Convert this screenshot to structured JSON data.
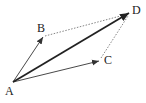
{
  "diagram": {
    "points": {
      "A": {
        "label": "A",
        "x": 13,
        "y": 82,
        "label_x": 5,
        "label_y": 95
      },
      "B": {
        "label": "B",
        "x": 43,
        "y": 37,
        "label_x": 37,
        "label_y": 32
      },
      "C": {
        "label": "C",
        "x": 99,
        "y": 61,
        "label_x": 104,
        "label_y": 64
      },
      "D": {
        "label": "D",
        "x": 129,
        "y": 13,
        "label_x": 132,
        "label_y": 14
      }
    },
    "vectors": [
      {
        "from": "A",
        "to": "B",
        "style": "thin-solid-arrow"
      },
      {
        "from": "A",
        "to": "C",
        "style": "thin-solid-arrow"
      },
      {
        "from": "A",
        "to": "D",
        "style": "thick-solid-arrow"
      }
    ],
    "dashed_segments": [
      {
        "from": "B",
        "to": "D",
        "style": "dotted"
      },
      {
        "from": "C",
        "to": "D",
        "style": "dotted"
      }
    ],
    "colors": {
      "line": "#333333",
      "dotted": "#555555",
      "background": "#ffffff"
    }
  }
}
